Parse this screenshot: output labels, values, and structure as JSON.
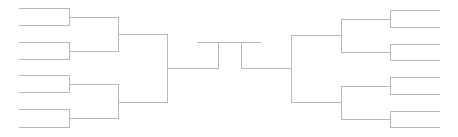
{
  "diagram": {
    "type": "tournament-bracket",
    "rounds_per_side": 3,
    "line_color": "#b8b8b8",
    "left": {
      "round1": {
        "x1": 19,
        "x2": 69,
        "ys": [
          8,
          25,
          42,
          59,
          75,
          92,
          109,
          127
        ]
      },
      "round2": {
        "x1": 69,
        "x2": 118,
        "ys": [
          17,
          51,
          84,
          118
        ]
      },
      "round3": {
        "x1": 118,
        "x2": 167,
        "ys": [
          34,
          102
        ]
      },
      "semifinal": {
        "x1": 167,
        "x2": 218,
        "y": 68
      }
    },
    "right": {
      "round1": {
        "x1": 390,
        "x2": 439,
        "ys": [
          10,
          27,
          44,
          60,
          77,
          94,
          111,
          127
        ]
      },
      "round2": {
        "x1": 341,
        "x2": 390,
        "ys": [
          19,
          52,
          86,
          119
        ]
      },
      "round3": {
        "x1": 291,
        "x2": 341,
        "ys": [
          35,
          102
        ]
      },
      "semifinal": {
        "x1": 241,
        "x2": 291,
        "y": 68
      }
    },
    "final": {
      "x1": 197,
      "x2": 260,
      "y": 42,
      "left_x": 218,
      "right_x": 241
    }
  }
}
